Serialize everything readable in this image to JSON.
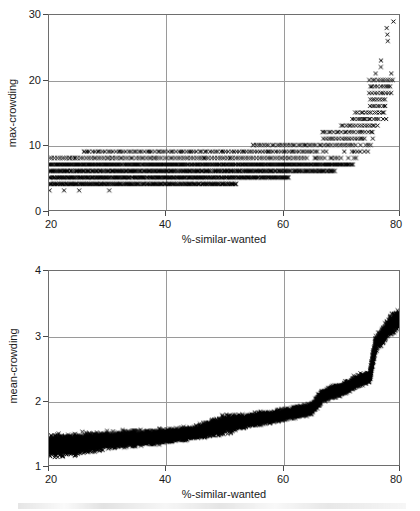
{
  "figure": {
    "background_color": "#ffffff",
    "marker_color": "#000000",
    "grid_color": "#9a9a9a",
    "axis_color": "#6e6e6e",
    "marker_symbol": "x"
  },
  "chart_data": [
    {
      "type": "scatter",
      "panel": "top",
      "title": "",
      "xlabel": "%-similar-wanted",
      "ylabel": "max-crowding",
      "xlim": [
        20,
        80
      ],
      "ylim": [
        0,
        30
      ],
      "xticks": [
        20,
        40,
        60,
        80
      ],
      "yticks": [
        0,
        10,
        20,
        30
      ],
      "xticklabels": [
        "20",
        "40",
        "60",
        "80"
      ],
      "yticklabels": [
        "0",
        "10",
        "20",
        "30"
      ],
      "grid": true,
      "gridlines_x": [
        40,
        60
      ],
      "gridlines_y": [
        10,
        20
      ],
      "legend": null,
      "marker": "x",
      "notes": "Integer-quantized max values form dense horizontal bands at 3-9 across most of the x-range, then rise steeply (exponentially) beyond x=65 up to ~29 at x=80.",
      "bands": [
        {
          "y": 3,
          "x_from": 20,
          "x_to": 33,
          "density": "sparse"
        },
        {
          "y": 4,
          "x_from": 20,
          "x_to": 52,
          "density": "dense"
        },
        {
          "y": 5,
          "x_from": 20,
          "x_to": 61,
          "density": "dense"
        },
        {
          "y": 6,
          "x_from": 20,
          "x_to": 69,
          "density": "dense"
        },
        {
          "y": 7,
          "x_from": 20,
          "x_to": 72,
          "density": "dense"
        },
        {
          "y": 8,
          "x_from": 20,
          "x_to": 74,
          "density": "medium"
        },
        {
          "y": 9,
          "x_from": 26,
          "x_to": 75,
          "density": "medium"
        },
        {
          "y": 10,
          "x_from": 55,
          "x_to": 76,
          "density": "medium"
        },
        {
          "y": 11,
          "x_from": 67,
          "x_to": 76,
          "density": "medium"
        },
        {
          "y": 12,
          "x_from": 67,
          "x_to": 77,
          "density": "medium"
        },
        {
          "y": 13,
          "x_from": 70,
          "x_to": 77,
          "density": "medium"
        },
        {
          "y": 14,
          "x_from": 72,
          "x_to": 78,
          "density": "medium"
        },
        {
          "y": 15,
          "x_from": 73,
          "x_to": 78,
          "density": "medium"
        },
        {
          "y": 16,
          "x_from": 75,
          "x_to": 78,
          "density": "medium"
        },
        {
          "y": 17,
          "x_from": 75,
          "x_to": 78,
          "density": "medium"
        },
        {
          "y": 18,
          "x_from": 75,
          "x_to": 79,
          "density": "medium"
        },
        {
          "y": 19,
          "x_from": 75,
          "x_to": 79,
          "density": "medium"
        },
        {
          "y": 20,
          "x_from": 75,
          "x_to": 80,
          "density": "medium"
        },
        {
          "y": 21,
          "x_from": 76,
          "x_to": 79,
          "density": "sparse"
        },
        {
          "y": 22,
          "x_from": 77,
          "x_to": 79,
          "density": "sparse"
        },
        {
          "y": 23,
          "x_from": 77,
          "x_to": 79,
          "density": "sparse"
        },
        {
          "y": 24,
          "x_from": 77,
          "x_to": 79,
          "density": "sparse"
        },
        {
          "y": 25,
          "x_from": 78,
          "x_to": 80,
          "density": "sparse"
        },
        {
          "y": 26,
          "x_from": 78,
          "x_to": 79,
          "density": "sparse"
        },
        {
          "y": 27,
          "x_from": 78,
          "x_to": 79,
          "density": "sparse"
        },
        {
          "y": 28,
          "x_from": 78,
          "x_to": 79,
          "density": "sparse"
        },
        {
          "y": 29,
          "x_from": 79,
          "x_to": 80,
          "density": "sparse"
        }
      ]
    },
    {
      "type": "scatter",
      "panel": "bottom",
      "title": "",
      "xlabel": "%-similar-wanted",
      "ylabel": "mean-crowding",
      "xlim": [
        20,
        80
      ],
      "ylim": [
        1,
        4
      ],
      "xticks": [
        20,
        40,
        60,
        80
      ],
      "yticks": [
        1,
        2,
        3,
        4
      ],
      "xticklabels": [
        "20",
        "40",
        "60",
        "80"
      ],
      "yticklabels": [
        "1",
        "2",
        "3",
        "4"
      ],
      "grid": true,
      "gridlines_x": [
        40,
        60
      ],
      "gridlines_y": [
        2,
        3
      ],
      "legend": null,
      "marker": "x",
      "notes": "A dense continuous cloud rising slowly from ~1.1-1.55 at x=20 to ~1.5-1.8 near x=50, with a step jump at x=50, gradual rise to ~2.0 at x=67, another step jump, then climbing steeply to ~3.0-3.5 at x=80.",
      "envelope": [
        {
          "x": 20,
          "low": 1.08,
          "high": 1.52
        },
        {
          "x": 25,
          "low": 1.12,
          "high": 1.52
        },
        {
          "x": 30,
          "low": 1.22,
          "high": 1.54
        },
        {
          "x": 35,
          "low": 1.26,
          "high": 1.56
        },
        {
          "x": 40,
          "low": 1.32,
          "high": 1.58
        },
        {
          "x": 45,
          "low": 1.38,
          "high": 1.62
        },
        {
          "x": 50,
          "low": 1.44,
          "high": 1.8
        },
        {
          "x": 55,
          "low": 1.58,
          "high": 1.82
        },
        {
          "x": 60,
          "low": 1.66,
          "high": 1.88
        },
        {
          "x": 65,
          "low": 1.76,
          "high": 1.98
        },
        {
          "x": 67,
          "low": 1.96,
          "high": 2.2
        },
        {
          "x": 70,
          "low": 2.04,
          "high": 2.28
        },
        {
          "x": 73,
          "low": 2.18,
          "high": 2.42
        },
        {
          "x": 75,
          "low": 2.26,
          "high": 2.46
        },
        {
          "x": 76,
          "low": 2.72,
          "high": 3.04
        },
        {
          "x": 78,
          "low": 2.92,
          "high": 3.28
        },
        {
          "x": 80,
          "low": 3.04,
          "high": 3.52
        }
      ]
    }
  ]
}
